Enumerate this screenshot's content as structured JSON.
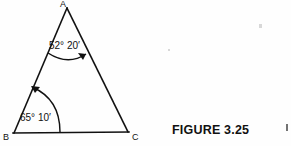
{
  "figure": {
    "caption": "FIGURE 3.25",
    "shape": "triangle",
    "stroke_color": "#111111",
    "background_color": "#fefefe",
    "vertices": [
      {
        "label": "A",
        "x": 67,
        "y": 8,
        "label_x": 63,
        "label_y": 6
      },
      {
        "label": "B",
        "x": 14,
        "y": 133,
        "label_x": 2,
        "label_y": 139
      },
      {
        "label": "C",
        "x": 128,
        "y": 132,
        "label_x": 132,
        "label_y": 139
      }
    ],
    "angles": [
      {
        "at": "A",
        "degrees": 52,
        "minutes": 20,
        "text": "52° 20′",
        "label_x": 49,
        "label_y": 49
      },
      {
        "at": "B",
        "degrees": 65,
        "minutes": 10,
        "text": "65° 10′",
        "label_x": 20,
        "label_y": 121
      }
    ]
  }
}
